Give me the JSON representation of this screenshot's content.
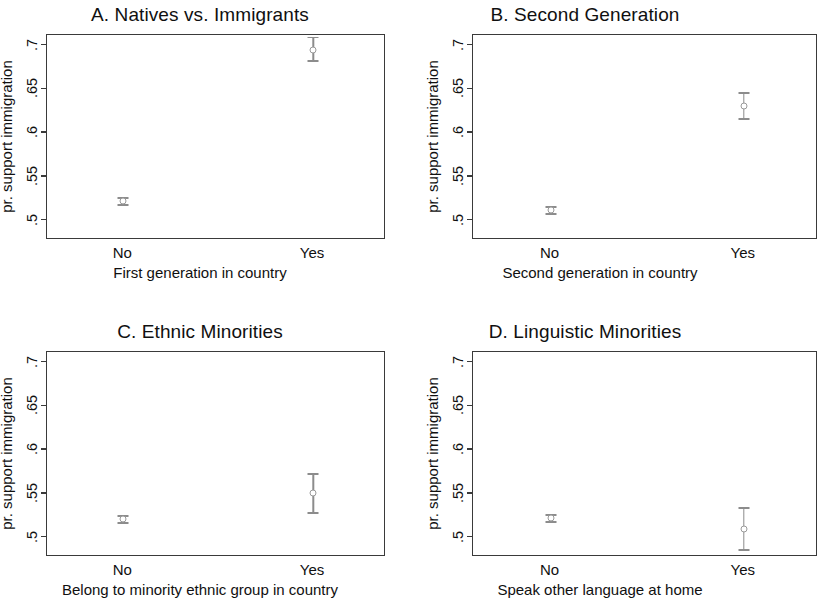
{
  "figure": {
    "width": 805,
    "height": 594,
    "shared_ylabel": "pr. support immigration",
    "shared_ytick_labels": [
      ".7",
      ".65",
      ".6",
      ".55",
      ".5"
    ],
    "shared_xtick_labels": [
      "No",
      "Yes"
    ],
    "marker_color": "#9a9a9a",
    "axis_color": "#3a3a3a"
  },
  "chart_data": [
    {
      "type": "scatter",
      "panel": "A",
      "title": "A. Natives vs. Immigrants",
      "xlabel": "First generation in country",
      "ylabel": "pr. support immigration",
      "categories": [
        "No",
        "Yes"
      ],
      "values": [
        0.522,
        0.695
      ],
      "ci_low": [
        0.518,
        0.682
      ],
      "ci_high": [
        0.526,
        0.709
      ],
      "ylim": [
        0.478,
        0.712
      ],
      "yticks": [
        0.5,
        0.55,
        0.6,
        0.65,
        0.7
      ],
      "ytick_labels": [
        ".5",
        ".55",
        ".6",
        ".65",
        ".7"
      ],
      "grid": false,
      "legend": "none"
    },
    {
      "type": "scatter",
      "panel": "B",
      "title": "B. Second Generation",
      "xlabel": "Second generation in country",
      "ylabel": "pr. support immigration",
      "categories": [
        "No",
        "Yes"
      ],
      "values": [
        0.512,
        0.631
      ],
      "ci_low": [
        0.508,
        0.616
      ],
      "ci_high": [
        0.516,
        0.646
      ],
      "ylim": [
        0.478,
        0.712
      ],
      "yticks": [
        0.5,
        0.55,
        0.6,
        0.65,
        0.7
      ],
      "ytick_labels": [
        ".5",
        ".55",
        ".6",
        ".65",
        ".7"
      ],
      "grid": false,
      "legend": "none"
    },
    {
      "type": "scatter",
      "panel": "C",
      "title": "C. Ethnic Minorities",
      "xlabel": "Belong to minority ethnic group in country",
      "ylabel": "pr. support immigration",
      "categories": [
        "No",
        "Yes"
      ],
      "values": [
        0.521,
        0.551
      ],
      "ci_low": [
        0.517,
        0.528
      ],
      "ci_high": [
        0.525,
        0.573
      ],
      "ylim": [
        0.478,
        0.712
      ],
      "yticks": [
        0.5,
        0.55,
        0.6,
        0.65,
        0.7
      ],
      "ytick_labels": [
        ".5",
        ".55",
        ".6",
        ".65",
        ".7"
      ],
      "grid": false,
      "legend": "none"
    },
    {
      "type": "scatter",
      "panel": "D",
      "title": "D. Linguistic Minorities",
      "xlabel": "Speak other language at home",
      "ylabel": "pr. support immigration",
      "categories": [
        "No",
        "Yes"
      ],
      "values": [
        0.522,
        0.51
      ],
      "ci_low": [
        0.518,
        0.486
      ],
      "ci_high": [
        0.526,
        0.534
      ],
      "ylim": [
        0.478,
        0.712
      ],
      "yticks": [
        0.5,
        0.55,
        0.6,
        0.65,
        0.7
      ],
      "ytick_labels": [
        ".5",
        ".55",
        ".6",
        ".65",
        ".7"
      ],
      "grid": false,
      "legend": "none"
    }
  ],
  "layout": {
    "panels": [
      {
        "key": "A",
        "left": 0,
        "top": 0,
        "width": 400,
        "height": 297,
        "box_left": 46,
        "box_top": 34,
        "box_width": 339,
        "box_height": 205,
        "overflow_right": false
      },
      {
        "key": "B",
        "left": 405,
        "top": 0,
        "width": 400,
        "height": 297,
        "box_left": 67,
        "box_top": 34,
        "box_width": 345,
        "box_height": 205,
        "overflow_right": true
      },
      {
        "key": "C",
        "left": 0,
        "top": 300,
        "width": 400,
        "height": 294,
        "box_left": 46,
        "box_top": 51,
        "box_width": 339,
        "box_height": 205,
        "overflow_right": false
      },
      {
        "key": "D",
        "left": 405,
        "top": 300,
        "width": 400,
        "height": 294,
        "box_left": 67,
        "box_top": 51,
        "box_width": 345,
        "box_height": 205,
        "overflow_right": true
      }
    ]
  }
}
